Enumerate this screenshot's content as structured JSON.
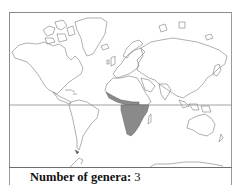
{
  "map": {
    "projection": "world",
    "highlighted_region": "Sub-Saharan Africa",
    "highlight_color": "#8a8a8a",
    "outline_color": "#7a7a7a",
    "equator_color": "#8c8c8c"
  },
  "caption": {
    "label": "Number of genera",
    "separator": ": ",
    "value": "3"
  }
}
